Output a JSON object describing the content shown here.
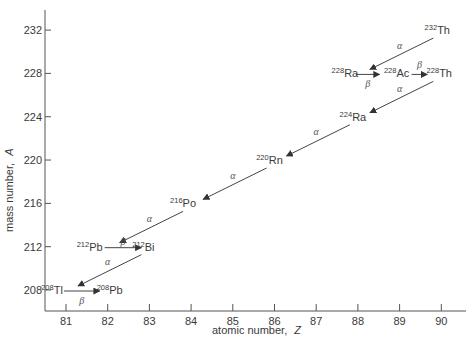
{
  "chart_data": {
    "type": "scatter",
    "title": "",
    "subtitle": "Thorium (4n) radioactive decay series",
    "xlabel": "atomic number,",
    "xlabel_symbol": "Z",
    "ylabel": "mass number,",
    "ylabel_symbol": "A",
    "xlim": [
      80.5,
      90.5
    ],
    "ylim": [
      206,
      233
    ],
    "grid": false,
    "legend": null,
    "x_ticks": [
      81,
      82,
      83,
      84,
      85,
      86,
      87,
      88,
      89,
      90
    ],
    "y_ticks": [
      208,
      212,
      216,
      220,
      224,
      228,
      232
    ],
    "nuclides": [
      {
        "symbol": "Th",
        "A": 232,
        "Z": 90
      },
      {
        "symbol": "Ra",
        "A": 228,
        "Z": 88
      },
      {
        "symbol": "Ac",
        "A": 228,
        "Z": 89
      },
      {
        "symbol": "Th",
        "A": 228,
        "Z": 90
      },
      {
        "symbol": "Ra",
        "A": 224,
        "Z": 88
      },
      {
        "symbol": "Rn",
        "A": 220,
        "Z": 86
      },
      {
        "symbol": "Po",
        "A": 216,
        "Z": 84
      },
      {
        "symbol": "Pb",
        "A": 212,
        "Z": 82
      },
      {
        "symbol": "Bi",
        "A": 212,
        "Z": 83
      },
      {
        "symbol": "Tl",
        "A": 208,
        "Z": 81
      },
      {
        "symbol": "Pb",
        "A": 208,
        "Z": 82
      }
    ],
    "decays": [
      {
        "from": "232Th",
        "to": "228Ra",
        "type": "alpha",
        "label": "α"
      },
      {
        "from": "228Ra",
        "to": "228Ac",
        "type": "beta",
        "label": "β"
      },
      {
        "from": "228Ac",
        "to": "228Th",
        "type": "beta",
        "label": "β"
      },
      {
        "from": "228Th",
        "to": "224Ra",
        "type": "alpha",
        "label": "α"
      },
      {
        "from": "224Ra",
        "to": "220Rn",
        "type": "alpha",
        "label": "α"
      },
      {
        "from": "220Rn",
        "to": "216Po",
        "type": "alpha",
        "label": "α"
      },
      {
        "from": "216Po",
        "to": "212Pb",
        "type": "alpha",
        "label": "α"
      },
      {
        "from": "212Pb",
        "to": "212Bi",
        "type": "beta",
        "label": "β"
      },
      {
        "from": "212Bi",
        "to": "208Tl",
        "type": "alpha",
        "label": "α"
      },
      {
        "from": "208Tl",
        "to": "208Pb",
        "type": "beta",
        "label": "β"
      }
    ]
  },
  "colors": {
    "axis": "#555555",
    "line": "#444444",
    "text": "#3a3a3a"
  }
}
